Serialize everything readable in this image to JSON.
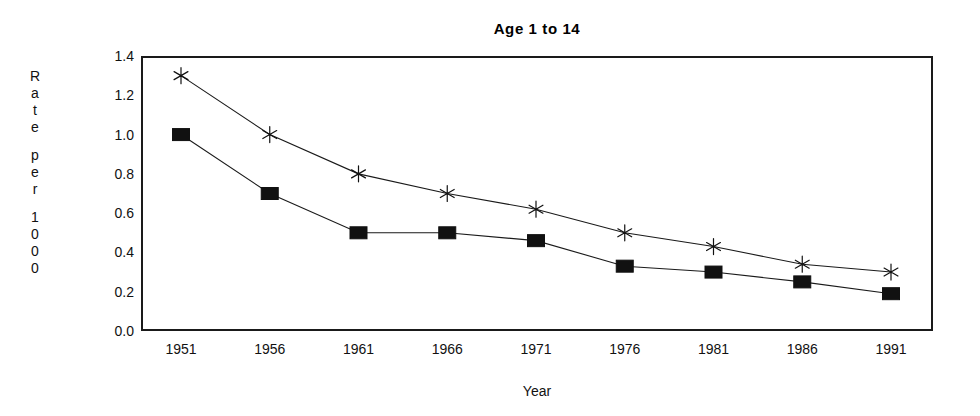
{
  "chart_data": {
    "type": "line",
    "title": "Age 1 to 14",
    "xlabel": "Year",
    "ylabel": "Rate per 1000",
    "ylabel_chars": [
      "R",
      "a",
      "t",
      "e",
      "",
      "p",
      "e",
      "r",
      "",
      "1",
      "0",
      "0",
      "0"
    ],
    "categories": [
      "1951",
      "1956",
      "1961",
      "1966",
      "1971",
      "1976",
      "1981",
      "1986",
      "1991"
    ],
    "x": [
      1951,
      1956,
      1961,
      1966,
      1971,
      1976,
      1981,
      1986,
      1991
    ],
    "ylim": [
      0.0,
      1.4
    ],
    "yticks": [
      "1.4",
      "1.2",
      "1.0",
      "0.8",
      "0.6",
      "0.4",
      "0.2",
      "0.0"
    ],
    "ytick_values": [
      1.4,
      1.2,
      1.0,
      0.8,
      0.6,
      0.4,
      0.2,
      0.0
    ],
    "grid": false,
    "legend": "none",
    "series": [
      {
        "name": "Series 1",
        "marker": "star",
        "color": "#111111",
        "values": [
          1.3,
          1.0,
          0.8,
          0.7,
          0.62,
          0.5,
          0.43,
          0.34,
          0.3
        ]
      },
      {
        "name": "Series 2",
        "marker": "square",
        "color": "#111111",
        "values": [
          1.0,
          0.7,
          0.5,
          0.5,
          0.46,
          0.33,
          0.3,
          0.25,
          0.19
        ]
      }
    ]
  }
}
